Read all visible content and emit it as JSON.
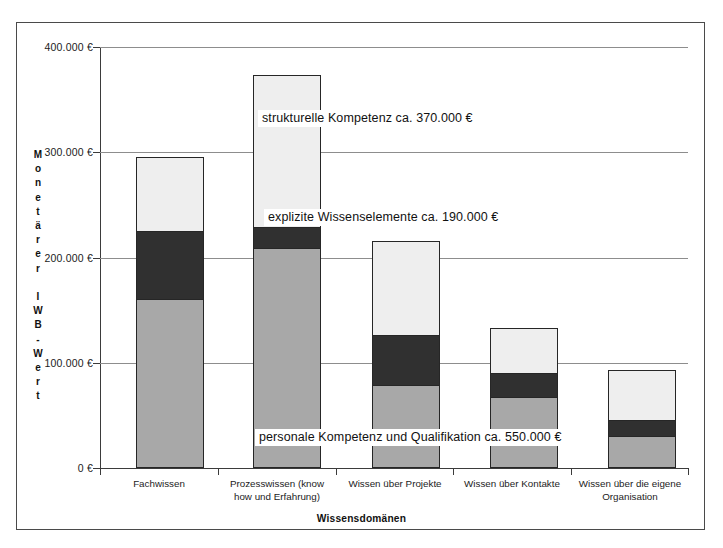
{
  "chart_data": {
    "type": "bar",
    "stacked": true,
    "title": "",
    "xlabel": "Wissensdomänen",
    "ylabel": "Monetärer IWB-Wert",
    "ylabel_chars": [
      "M",
      "o",
      "n",
      "e",
      "t",
      "ä",
      "r",
      "e",
      "r",
      " ",
      "I",
      "W",
      "B",
      "-",
      "W",
      "e",
      "r",
      "t"
    ],
    "ylim": [
      0,
      400000
    ],
    "ytick_values": [
      0,
      100000,
      200000,
      300000,
      400000
    ],
    "ytick_labels": [
      "0 €",
      "100.000 €",
      "200.000 €",
      "300.000 €",
      "400.000 €"
    ],
    "grid": true,
    "legend": "none",
    "currency": "€",
    "categories": [
      "Fachwissen",
      "Prozesswissen (know how und Erfahrung)",
      "Wissen über Projekte",
      "Wissen über Kontakte",
      "Wissen über die eigene Organisation"
    ],
    "category_lines": [
      [
        "Fachwissen"
      ],
      [
        "Prozesswissen (know",
        "how und Erfahrung)"
      ],
      [
        "Wissen über Projekte"
      ],
      [
        "Wissen über Kontakte"
      ],
      [
        "Wissen über die eigene",
        "Organisation"
      ]
    ],
    "series": [
      {
        "name": "personale Kompetenz und Qualifikation",
        "color": "#a8a8a8",
        "values": [
          160000,
          205000,
          80000,
          67000,
          30000
        ]
      },
      {
        "name": "explizite Wissenselemente",
        "color": "#303030",
        "values": [
          65000,
          20000,
          48000,
          23000,
          15000
        ]
      },
      {
        "name": "strukturelle Kompetenz",
        "color": "#eeeeee",
        "values": [
          71000,
          145000,
          90000,
          43000,
          48000
        ]
      }
    ],
    "totals": [
      296000,
      370000,
      218000,
      133000,
      93000
    ],
    "annotations": [
      {
        "id": "structural",
        "text": "strukturelle Kompetenz ca. 370.000 €",
        "series": "strukturelle Kompetenz",
        "value": 370000
      },
      {
        "id": "explicit",
        "text": "explizite Wissenselemente ca. 190.000 €",
        "series": "explizite Wissenselemente",
        "value": 190000
      },
      {
        "id": "personal",
        "text": "personale Kompetenz und  Qualifikation ca. 550.000 €",
        "series": "personale Kompetenz und Qualifikation",
        "value": 550000
      }
    ]
  }
}
